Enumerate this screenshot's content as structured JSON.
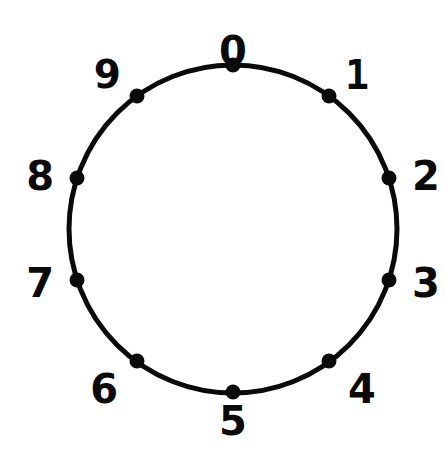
{
  "figure": {
    "title": "",
    "background_color": "#ffffff",
    "stroke_color": "#0a0a0a",
    "node_fill_color": "#0a0a0a",
    "label_color": "#0a0a0a"
  },
  "chart_data": {
    "type": "scatter",
    "title": "",
    "subtitle": "",
    "xlabel": "",
    "ylabel": "",
    "grid": false,
    "legend": null,
    "shape": "circle",
    "center": {
      "x": 233,
      "y": 229
    },
    "radius": 164,
    "point_count": 10,
    "angle_step_degrees": 36,
    "start_angle_degrees": 90,
    "direction": "clockwise",
    "categories": [
      "0",
      "1",
      "2",
      "3",
      "4",
      "5",
      "6",
      "7",
      "8",
      "9"
    ],
    "values": [
      0,
      36,
      72,
      108,
      144,
      180,
      216,
      252,
      288,
      324
    ],
    "points": [
      {
        "label": "0",
        "angle_degrees": 0,
        "cx": 233,
        "cy": 65,
        "label_x": 233,
        "label_y": 31,
        "label_anchor": "top-center",
        "glyph_style": "normal"
      },
      {
        "label": "1",
        "angle_degrees": 36,
        "cx": 329,
        "cy": 96,
        "label_x": 345,
        "label_y": 55,
        "label_anchor": "top-left",
        "glyph_style": "bar"
      },
      {
        "label": "2",
        "angle_degrees": 72,
        "cx": 389,
        "cy": 178,
        "label_x": 412,
        "label_y": 156,
        "label_anchor": "middle-left",
        "glyph_style": "normal"
      },
      {
        "label": "3",
        "angle_degrees": 108,
        "cx": 389,
        "cy": 280,
        "label_x": 412,
        "label_y": 263,
        "label_anchor": "middle-left",
        "glyph_style": "normal"
      },
      {
        "label": "4",
        "angle_degrees": 144,
        "cx": 329,
        "cy": 361,
        "label_x": 348,
        "label_y": 369,
        "label_anchor": "bottom-left",
        "glyph_style": "normal"
      },
      {
        "label": "5",
        "angle_degrees": 180,
        "cx": 233,
        "cy": 392,
        "label_x": 233,
        "label_y": 401,
        "label_anchor": "bottom-center",
        "glyph_style": "normal"
      },
      {
        "label": "6",
        "angle_degrees": 216,
        "cx": 137,
        "cy": 361,
        "label_x": 118,
        "label_y": 369,
        "label_anchor": "bottom-right",
        "glyph_style": "normal"
      },
      {
        "label": "7",
        "angle_degrees": 252,
        "cx": 77,
        "cy": 280,
        "label_x": 54,
        "label_y": 263,
        "label_anchor": "middle-right",
        "glyph_style": "normal"
      },
      {
        "label": "8",
        "angle_degrees": 288,
        "cx": 77,
        "cy": 178,
        "label_x": 54,
        "label_y": 156,
        "label_anchor": "middle-right",
        "glyph_style": "normal"
      },
      {
        "label": "9",
        "angle_degrees": 324,
        "cx": 137,
        "cy": 96,
        "label_x": 121,
        "label_y": 55,
        "label_anchor": "top-right",
        "glyph_style": "nine"
      }
    ]
  }
}
